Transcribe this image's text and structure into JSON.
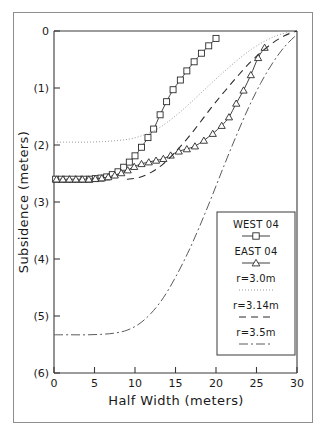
{
  "chart_data": {
    "type": "line",
    "title": "",
    "xlabel": "Half Width (meters)",
    "ylabel": "Subsidence (meters)",
    "xlim": [
      0,
      30
    ],
    "ylim": [
      -6,
      0
    ],
    "xticks": [
      0,
      5,
      10,
      15,
      20,
      25,
      30
    ],
    "xtick_labels": [
      "0",
      "5",
      "10",
      "15",
      "20",
      "25",
      "30"
    ],
    "yticks": [
      0,
      -1,
      -2,
      -3,
      -4,
      -5,
      -6
    ],
    "ytick_labels": [
      "0",
      "(1)",
      "(2)",
      "(3)",
      "(4)",
      "(5)",
      "(6)"
    ],
    "grid": false,
    "legend_position": "lower right",
    "series": [
      {
        "name": "WEST 04",
        "style": "line-with-open-square-markers",
        "marker": "square",
        "points": [
          [
            0.2,
            -2.6
          ],
          [
            0.9,
            -2.6
          ],
          [
            1.6,
            -2.6
          ],
          [
            2.3,
            -2.6
          ],
          [
            3.0,
            -2.6
          ],
          [
            3.7,
            -2.6
          ],
          [
            4.4,
            -2.6
          ],
          [
            5.1,
            -2.59
          ],
          [
            5.8,
            -2.58
          ],
          [
            6.5,
            -2.56
          ],
          [
            7.2,
            -2.52
          ],
          [
            7.9,
            -2.47
          ],
          [
            8.6,
            -2.39
          ],
          [
            9.3,
            -2.3
          ],
          [
            10.0,
            -2.19
          ],
          [
            10.8,
            -2.04
          ],
          [
            11.6,
            -1.87
          ],
          [
            12.3,
            -1.72
          ],
          [
            13.1,
            -1.47
          ],
          [
            13.9,
            -1.24
          ],
          [
            14.7,
            -1.03
          ],
          [
            15.6,
            -0.86
          ],
          [
            16.4,
            -0.7
          ],
          [
            17.3,
            -0.54
          ],
          [
            18.2,
            -0.39
          ],
          [
            19.1,
            -0.26
          ],
          [
            20.0,
            -0.13
          ]
        ]
      },
      {
        "name": "EAST 04",
        "style": "line-with-open-triangle-markers",
        "marker": "triangle",
        "points": [
          [
            0.3,
            -2.6
          ],
          [
            1.1,
            -2.6
          ],
          [
            1.9,
            -2.6
          ],
          [
            2.7,
            -2.6
          ],
          [
            3.5,
            -2.6
          ],
          [
            4.3,
            -2.6
          ],
          [
            5.1,
            -2.59
          ],
          [
            5.9,
            -2.58
          ],
          [
            6.7,
            -2.56
          ],
          [
            7.5,
            -2.53
          ],
          [
            8.3,
            -2.49
          ],
          [
            9.1,
            -2.44
          ],
          [
            9.9,
            -2.38
          ],
          [
            10.8,
            -2.33
          ],
          [
            11.7,
            -2.3
          ],
          [
            12.6,
            -2.27
          ],
          [
            13.5,
            -2.24
          ],
          [
            14.4,
            -2.18
          ],
          [
            15.4,
            -2.11
          ],
          [
            16.4,
            -2.07
          ],
          [
            17.4,
            -2.02
          ],
          [
            18.5,
            -1.92
          ],
          [
            19.6,
            -1.8
          ],
          [
            20.7,
            -1.66
          ],
          [
            21.6,
            -1.51
          ],
          [
            22.5,
            -1.27
          ],
          [
            23.4,
            -1.04
          ],
          [
            24.3,
            -0.77
          ],
          [
            25.2,
            -0.47
          ],
          [
            26.0,
            -0.29
          ]
        ]
      },
      {
        "name": "r=3.0m",
        "style": "dotted",
        "marker": "none",
        "points": [
          [
            0.0,
            -1.95
          ],
          [
            2.0,
            -1.95
          ],
          [
            4.0,
            -1.95
          ],
          [
            6.0,
            -1.94
          ],
          [
            8.0,
            -1.92
          ],
          [
            9.5,
            -1.89
          ],
          [
            11.0,
            -1.83
          ],
          [
            12.5,
            -1.74
          ],
          [
            14.0,
            -1.6
          ],
          [
            15.5,
            -1.43
          ],
          [
            17.0,
            -1.24
          ],
          [
            18.5,
            -1.04
          ],
          [
            20.0,
            -0.84
          ],
          [
            21.5,
            -0.65
          ],
          [
            23.0,
            -0.47
          ],
          [
            24.5,
            -0.31
          ],
          [
            26.0,
            -0.18
          ],
          [
            27.5,
            -0.08
          ],
          [
            29.0,
            -0.02
          ],
          [
            30.0,
            0.0
          ]
        ]
      },
      {
        "name": "r=3.14m",
        "style": "dashed",
        "marker": "none",
        "points": [
          [
            9.0,
            -2.6
          ],
          [
            10.5,
            -2.57
          ],
          [
            12.0,
            -2.48
          ],
          [
            13.5,
            -2.33
          ],
          [
            15.0,
            -2.12
          ],
          [
            16.5,
            -1.88
          ],
          [
            18.0,
            -1.61
          ],
          [
            19.5,
            -1.33
          ],
          [
            21.0,
            -1.07
          ],
          [
            22.5,
            -0.82
          ],
          [
            24.0,
            -0.58
          ],
          [
            25.5,
            -0.38
          ],
          [
            27.0,
            -0.21
          ],
          [
            28.5,
            -0.08
          ],
          [
            30.0,
            0.0
          ]
        ]
      },
      {
        "name": "r=3.5m",
        "style": "dash-dot",
        "marker": "none",
        "points": [
          [
            0.0,
            -5.33
          ],
          [
            2.0,
            -5.33
          ],
          [
            4.0,
            -5.33
          ],
          [
            6.0,
            -5.32
          ],
          [
            7.5,
            -5.3
          ],
          [
            9.0,
            -5.25
          ],
          [
            10.5,
            -5.14
          ],
          [
            12.0,
            -4.95
          ],
          [
            13.5,
            -4.68
          ],
          [
            15.0,
            -4.32
          ],
          [
            16.5,
            -3.9
          ],
          [
            18.0,
            -3.42
          ],
          [
            19.5,
            -2.9
          ],
          [
            21.0,
            -2.36
          ],
          [
            22.5,
            -1.84
          ],
          [
            24.0,
            -1.35
          ],
          [
            25.5,
            -0.92
          ],
          [
            27.0,
            -0.56
          ],
          [
            28.5,
            -0.27
          ],
          [
            30.0,
            -0.06
          ]
        ]
      }
    ],
    "legend_entries": [
      {
        "label": "WEST 04",
        "style": "line-with-open-square-markers"
      },
      {
        "label": "EAST 04",
        "style": "line-with-open-triangle-markers"
      },
      {
        "label": "r=3.0m",
        "style": "dotted"
      },
      {
        "label": "r=3.14m",
        "style": "dashed"
      },
      {
        "label": "r=3.5m",
        "style": "dash-dot"
      }
    ],
    "colors": {
      "axis": "#3a3a3a",
      "data": "#2b2b2b",
      "model_dotted": "#9a9a9a",
      "model_dashed": "#2b2b2b",
      "model_dashdot": "#5a5a5a",
      "background": "#ffffff"
    }
  }
}
